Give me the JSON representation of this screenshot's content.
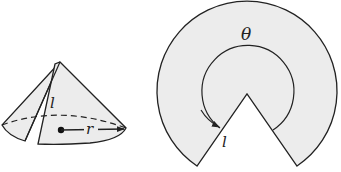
{
  "figure": {
    "cone": {
      "slant_label": "l",
      "radius_label": "r"
    },
    "sector": {
      "angle_label": "θ",
      "radius_label": "l"
    },
    "colors": {
      "fill": "#ececec",
      "stroke": "#222222"
    }
  }
}
